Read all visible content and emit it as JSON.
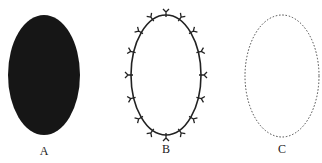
{
  "figures": [
    {
      "id": "A",
      "label": "A",
      "style": "filled",
      "fill": "#161616",
      "cx": 44,
      "cy": 75,
      "rx": 36,
      "ry": 60,
      "label_x": 44,
      "label_y": 152
    },
    {
      "id": "B",
      "label": "B",
      "style": "outline-with-y-markers",
      "stroke": "#222222",
      "cx": 166,
      "cy": 75,
      "rx": 35,
      "ry": 60,
      "marker_count": 16,
      "label_x": 166,
      "label_y": 150
    },
    {
      "id": "C",
      "label": "C",
      "style": "dotted",
      "stroke": "#444444",
      "cx": 282,
      "cy": 76,
      "rx": 37,
      "ry": 61,
      "label_x": 282,
      "label_y": 150
    }
  ]
}
